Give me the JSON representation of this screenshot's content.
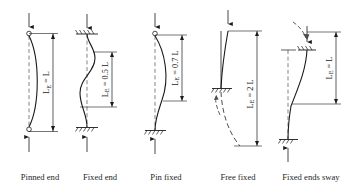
{
  "figure": {
    "stroke_color": "#1a1a1a",
    "dash_color": "#4d4d4d"
  },
  "cases": [
    {
      "id": "pinned-end",
      "caption": "Pinned end",
      "effective_length_label": "L",
      "effective_length_factor": 1.0,
      "dim_text": "L",
      "dim_prefix": "L",
      "dim_sub": "E",
      "dim_eq": " = ",
      "top_support": "pin",
      "bottom_support": "pin",
      "top_load": "down-arrow",
      "bottom_load": "up-arrow",
      "has_mirror_dashed": false,
      "has_sway_arrow": false
    },
    {
      "id": "fixed-end",
      "caption": "Fixed end",
      "effective_length_label": "0.5 L",
      "effective_length_factor": 0.5,
      "dim_text": "0.5 L",
      "dim_prefix": "L",
      "dim_sub": "E",
      "dim_eq": " = ",
      "top_support": "fixed-hatch",
      "bottom_support": "fixed-hatch",
      "top_load": "down-arrow",
      "bottom_load": "up-arrow",
      "has_mirror_dashed": false,
      "has_sway_arrow": false
    },
    {
      "id": "pin-fixed",
      "caption": "Pin fixed",
      "effective_length_label": "0.7 L",
      "effective_length_factor": 0.7,
      "dim_text": "0.7 L",
      "dim_prefix": "L",
      "dim_sub": "E",
      "dim_eq": " = ",
      "top_support": "pin",
      "bottom_support": "fixed-hatch",
      "top_load": "down-arrow",
      "bottom_load": "up-arrow",
      "has_mirror_dashed": false,
      "has_sway_arrow": false
    },
    {
      "id": "free-fixed",
      "caption": "Free fixed",
      "effective_length_label": "2 L",
      "effective_length_factor": 2.0,
      "dim_text": "2 L",
      "dim_prefix": "L",
      "dim_sub": "E",
      "dim_eq": " = ",
      "top_support": "free",
      "bottom_support": "fixed-hatch",
      "top_load": "down-arrow",
      "bottom_load": "none",
      "has_mirror_dashed": true,
      "has_sway_arrow": true
    },
    {
      "id": "fixed-ends-sway",
      "caption": "Fixed ends sway",
      "effective_length_label": "L",
      "effective_length_factor": 1.0,
      "dim_text": "L",
      "dim_prefix": "L",
      "dim_sub": "E",
      "dim_eq": " = ",
      "top_support": "fixed-hatch",
      "bottom_support": "fixed-hatch",
      "top_load": "down-arrow",
      "bottom_load": "up-arrow",
      "has_mirror_dashed": true,
      "has_sway_arrow": true
    }
  ]
}
